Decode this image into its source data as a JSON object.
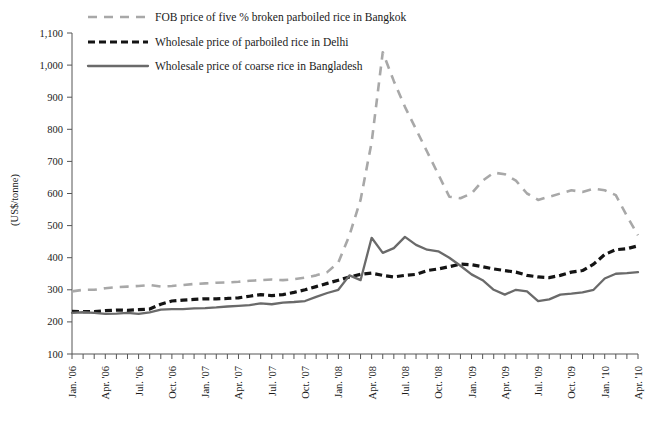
{
  "chart_data": {
    "type": "line",
    "title": "",
    "xlabel": "",
    "ylabel": "(US$/tonne)",
    "ylim": [
      100,
      1100
    ],
    "ytick_labels": [
      "100",
      "200",
      "300",
      "400",
      "500",
      "600",
      "700",
      "800",
      "900",
      "1,000",
      "1,100"
    ],
    "yticks": [
      100,
      200,
      300,
      400,
      500,
      600,
      700,
      800,
      900,
      1000,
      1100
    ],
    "grid": false,
    "legend_position": "top-left",
    "x": [
      "Jan. '06",
      "Feb. '06",
      "Mar. '06",
      "Apr. '06",
      "May '06",
      "Jun. '06",
      "Jul. '06",
      "Aug. '06",
      "Sep. '06",
      "Oct. '06",
      "Nov. '06",
      "Dec. '06",
      "Jan. '07",
      "Feb. '07",
      "Mar. '07",
      "Apr. '07",
      "May '07",
      "Jun. '07",
      "Jul. '07",
      "Aug. '07",
      "Sep. '07",
      "Oct. '07",
      "Nov. '07",
      "Dec. '07",
      "Jan. '08",
      "Feb. '08",
      "Mar. '08",
      "Apr. '08",
      "May '08",
      "Jun. '08",
      "Jul. '08",
      "Aug. '08",
      "Sep. '08",
      "Oct. '08",
      "Nov. '08",
      "Dec. '08",
      "Jan. '09",
      "Feb. '09",
      "Mar. '09",
      "Apr. '09",
      "May '09",
      "Jun. '09",
      "Jul. '09",
      "Aug. '09",
      "Sep. '09",
      "Oct. '09",
      "Nov. '09",
      "Dec. '09",
      "Jan. '10",
      "Feb. '10",
      "Mar. '10",
      "Apr. '10"
    ],
    "x_tick_labels": [
      "Jan. '06",
      "Apr. '06",
      "Jul. '06",
      "Oct. '06",
      "Jan. '07",
      "Apr. '07",
      "Jul. '07",
      "Oct. '07",
      "Jan. '08",
      "Apr. '08",
      "Jul. '08",
      "Oct. '08",
      "Jan. '09",
      "Apr. '09",
      "Jul. '09",
      "Oct. '09",
      "Jan. '10",
      "Apr. '10"
    ],
    "x_tick_indices": [
      0,
      3,
      6,
      9,
      12,
      15,
      18,
      21,
      24,
      27,
      30,
      33,
      36,
      39,
      42,
      45,
      48,
      51
    ],
    "series": [
      {
        "name": "FOB price of five % broken parboiled rice in Bangkok",
        "style": "long-dash",
        "color": "#a8a8a8",
        "values": [
          295,
          300,
          300,
          305,
          308,
          310,
          312,
          315,
          310,
          312,
          315,
          318,
          320,
          322,
          323,
          325,
          328,
          330,
          332,
          330,
          333,
          338,
          345,
          355,
          385,
          470,
          580,
          760,
          1040,
          950,
          870,
          800,
          730,
          660,
          590,
          585,
          600,
          640,
          665,
          660,
          640,
          600,
          580,
          590,
          600,
          610,
          605,
          615,
          610,
          595,
          530,
          470
        ]
      },
      {
        "name": "Wholesale price of parboiled rice in Delhi",
        "style": "short-dash",
        "color": "#141414",
        "values": [
          233,
          232,
          232,
          235,
          237,
          236,
          238,
          240,
          255,
          265,
          268,
          270,
          272,
          272,
          273,
          275,
          280,
          285,
          282,
          285,
          292,
          300,
          310,
          320,
          330,
          340,
          348,
          352,
          345,
          340,
          345,
          348,
          360,
          365,
          372,
          380,
          378,
          372,
          365,
          360,
          355,
          345,
          340,
          338,
          345,
          355,
          360,
          380,
          410,
          425,
          428,
          437
        ]
      },
      {
        "name": "Wholesale price of coarse rice in Bangladesh",
        "style": "solid",
        "color": "#6a6a6a",
        "values": [
          228,
          230,
          228,
          225,
          226,
          228,
          225,
          230,
          238,
          240,
          240,
          242,
          243,
          245,
          248,
          250,
          252,
          258,
          255,
          260,
          262,
          265,
          278,
          290,
          300,
          345,
          330,
          462,
          415,
          430,
          465,
          440,
          425,
          420,
          400,
          375,
          348,
          330,
          300,
          285,
          300,
          295,
          265,
          270,
          285,
          288,
          292,
          300,
          335,
          350,
          352,
          355
        ]
      }
    ]
  },
  "axis": {
    "ylabel": "(US$/tonne)"
  }
}
